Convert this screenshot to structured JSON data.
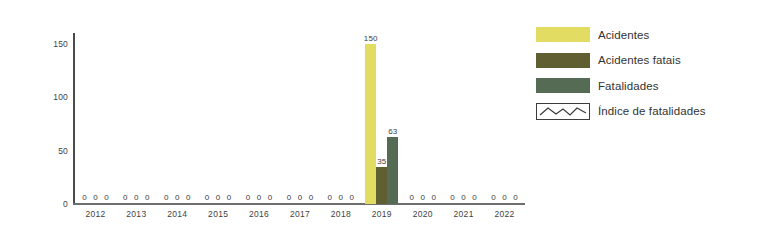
{
  "chart_data": {
    "type": "bar",
    "title": "",
    "subtitle": "",
    "xlabel": "",
    "ylabel": "",
    "ylim": [
      0,
      160
    ],
    "y_ticks": [
      0,
      50,
      100,
      150
    ],
    "grid": false,
    "legend_position": "right",
    "categories": [
      "2012",
      "2013",
      "2014",
      "2015",
      "2016",
      "2017",
      "2018",
      "2019",
      "2020",
      "2021",
      "2022"
    ],
    "series": [
      {
        "name": "Acidentes",
        "color": "#e2dd62",
        "values": [
          0,
          0,
          0,
          0,
          0,
          0,
          0,
          150,
          0,
          0,
          0
        ]
      },
      {
        "name": "Acidentes fatais",
        "color": "#5f5f31",
        "values": [
          0,
          0,
          0,
          0,
          0,
          0,
          0,
          35,
          0,
          0,
          0
        ]
      },
      {
        "name": "Fatalidades",
        "color": "#566b53",
        "values": [
          0,
          0,
          0,
          0,
          0,
          0,
          0,
          63,
          0,
          0,
          0
        ]
      },
      {
        "name": "Índice de fatalidades",
        "color": "#3c3c3c",
        "type": "line",
        "values": [
          0,
          0,
          0,
          0,
          0,
          0,
          0,
          0,
          0,
          0,
          0
        ]
      }
    ]
  },
  "axis": {
    "y_tick_labels": [
      "150",
      "100",
      "50",
      "0"
    ],
    "x_tick_labels": [
      "2012",
      "2013",
      "2014",
      "2015",
      "2016",
      "2017",
      "2018",
      "2019",
      "2020",
      "2021",
      "2022"
    ]
  },
  "legend": {
    "items": [
      {
        "label": "Acidentes",
        "color": "#e2dd62",
        "marker": "swatch"
      },
      {
        "label": "Acidentes fatais",
        "color": "#5f5f31",
        "marker": "swatch"
      },
      {
        "label": "Fatalidades",
        "color": "#566b53",
        "marker": "swatch"
      },
      {
        "label": "Índice de fatalidades",
        "color": "#3c3c3c",
        "marker": "line-box"
      }
    ]
  },
  "colors": {
    "acidentes": "#e2dd62",
    "acidentes_fatais": "#5f5f31",
    "fatalidades": "#566b53",
    "axis": "#4b4b4b",
    "text": "#333333",
    "background": "#ffffff"
  }
}
